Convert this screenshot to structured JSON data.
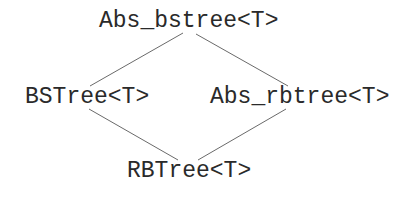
{
  "diagram": {
    "type": "class-hierarchy",
    "nodes": [
      {
        "id": "abs_bstree",
        "label": "Abs_bstree<T>"
      },
      {
        "id": "bstree",
        "label": "BSTree<T>"
      },
      {
        "id": "abs_rbtree",
        "label": "Abs_rbtree<T>"
      },
      {
        "id": "rbtree",
        "label": "RBTree<T>"
      }
    ],
    "edges": [
      {
        "from": "abs_bstree",
        "to": "bstree"
      },
      {
        "from": "abs_bstree",
        "to": "abs_rbtree"
      },
      {
        "from": "bstree",
        "to": "rbtree"
      },
      {
        "from": "abs_rbtree",
        "to": "rbtree"
      }
    ],
    "colors": {
      "text": "#2a2a2a",
      "line": "#6a6a6a",
      "background": "#ffffff"
    }
  }
}
